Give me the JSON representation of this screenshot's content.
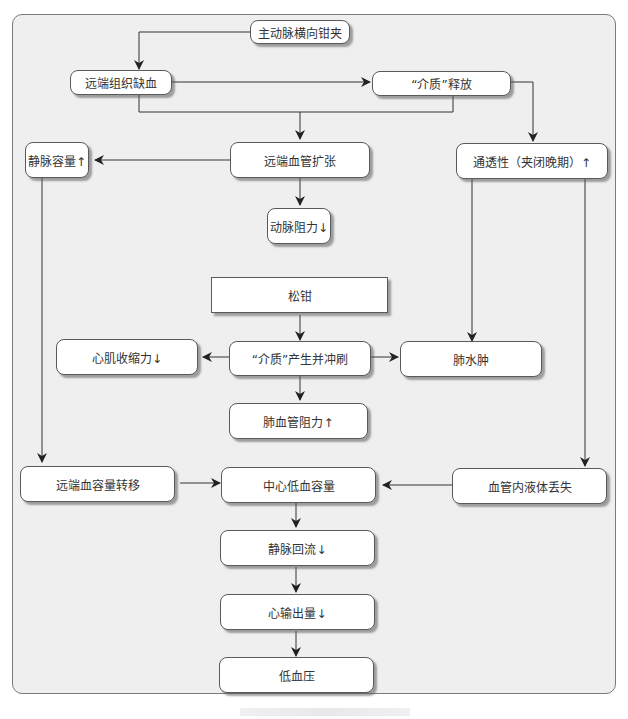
{
  "diagram": {
    "type": "flowchart",
    "colors": {
      "panel_bg": "#efefef",
      "node_bg": "#ffffff",
      "border": "#5a5a5a",
      "line": "#333333"
    },
    "nodes": {
      "aortic_clamp": "主动脉横向钳夹",
      "distal_ischemia": "远端组织缺血",
      "mediator_release": "“介质”释放",
      "venous_capacity": "静脉容量↑",
      "distal_vasodilation": "远端血管扩张",
      "permeability": "通透性（夹闭晚期）↑",
      "arterial_resistance": "动脉阻力↓",
      "unclamp": "松钳",
      "myocardial_contractility": "心肌收缩力↓",
      "mediator_washout": "“介质”产生并冲刷",
      "pulmonary_edema": "肺水肿",
      "pulmonary_vascular_resistance": "肺血管阻力↑",
      "distal_volume_shift": "远端血容量转移",
      "central_hypovolemia": "中心低血容量",
      "intravascular_fluid_loss": "血管内液体丢失",
      "venous_return": "静脉回流↓",
      "cardiac_output": "心输出量↓",
      "hypotension": "低血压"
    },
    "edges": [
      [
        "aortic_clamp",
        "distal_ischemia"
      ],
      [
        "distal_ischemia",
        "mediator_release"
      ],
      [
        "distal_ischemia",
        "distal_vasodilation"
      ],
      [
        "mediator_release",
        "distal_vasodilation"
      ],
      [
        "mediator_release",
        "permeability"
      ],
      [
        "distal_vasodilation",
        "venous_capacity"
      ],
      [
        "distal_vasodilation",
        "arterial_resistance"
      ],
      [
        "unclamp",
        "mediator_washout"
      ],
      [
        "mediator_washout",
        "myocardial_contractility"
      ],
      [
        "mediator_washout",
        "pulmonary_edema"
      ],
      [
        "mediator_washout",
        "pulmonary_vascular_resistance"
      ],
      [
        "permeability",
        "pulmonary_edema"
      ],
      [
        "permeability",
        "intravascular_fluid_loss"
      ],
      [
        "venous_capacity",
        "distal_volume_shift"
      ],
      [
        "distal_volume_shift",
        "central_hypovolemia"
      ],
      [
        "intravascular_fluid_loss",
        "central_hypovolemia"
      ],
      [
        "central_hypovolemia",
        "venous_return"
      ],
      [
        "venous_return",
        "cardiac_output"
      ],
      [
        "cardiac_output",
        "hypotension"
      ]
    ]
  }
}
